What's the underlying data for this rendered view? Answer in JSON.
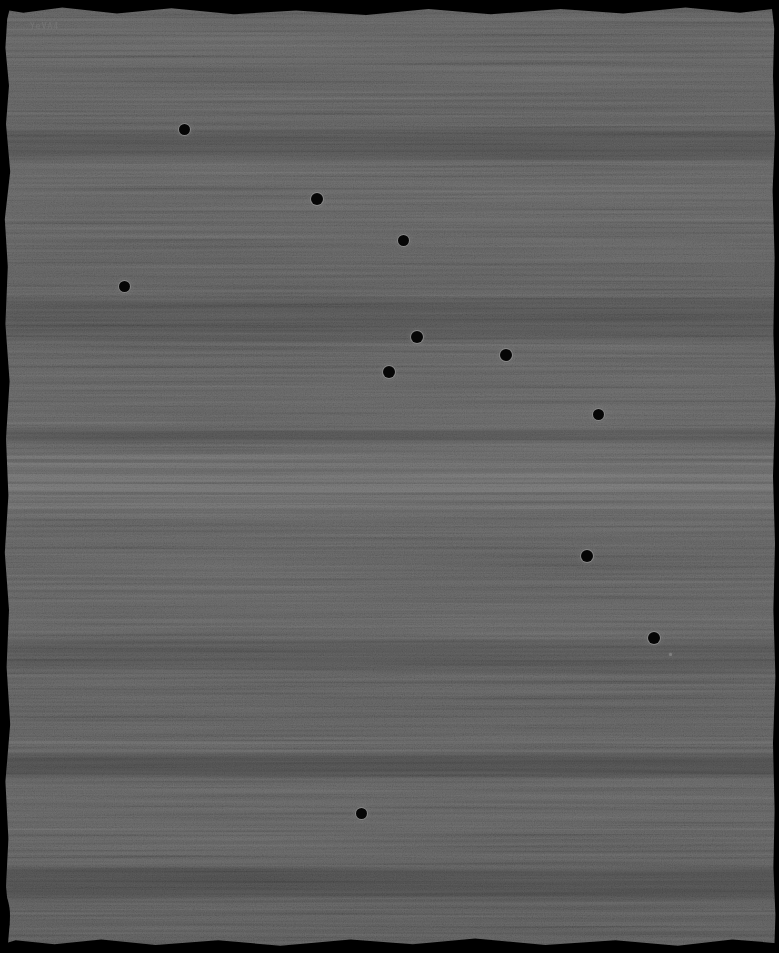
{
  "frame": {
    "label": "YeVA4",
    "width": 779,
    "height": 953,
    "background_color": "#1f1f1f",
    "edge_color": "#000000",
    "hole_core_color": "#060606",
    "hole_rim_color": "#a0a0a0",
    "label_color": "#787878"
  },
  "punch_holes": [
    {
      "x": 184,
      "y": 129,
      "d": 11,
      "type": "hole"
    },
    {
      "x": 317,
      "y": 199,
      "d": 12,
      "type": "hole"
    },
    {
      "x": 403,
      "y": 240,
      "d": 11,
      "type": "hole"
    },
    {
      "x": 124,
      "y": 286,
      "d": 11,
      "type": "hole"
    },
    {
      "x": 417,
      "y": 337,
      "d": 12,
      "type": "hole"
    },
    {
      "x": 506,
      "y": 355,
      "d": 12,
      "type": "hole"
    },
    {
      "x": 389,
      "y": 372,
      "d": 12,
      "type": "hole"
    },
    {
      "x": 598,
      "y": 414,
      "d": 11,
      "type": "hole"
    },
    {
      "x": 587,
      "y": 556,
      "d": 12,
      "type": "hole"
    },
    {
      "x": 654,
      "y": 638,
      "d": 12,
      "type": "hole"
    },
    {
      "x": 670,
      "y": 654,
      "d": 3,
      "type": "speck"
    },
    {
      "x": 361,
      "y": 813,
      "d": 11,
      "type": "hole"
    }
  ],
  "light_bands": [
    {
      "y": 18,
      "h": 3,
      "opacity": 0.05
    },
    {
      "y": 58,
      "h": 2,
      "opacity": 0.035
    },
    {
      "y": 98,
      "h": 2,
      "opacity": 0.03
    },
    {
      "y": 162,
      "h": 3,
      "opacity": 0.07
    },
    {
      "y": 235,
      "h": 2,
      "opacity": 0.03
    },
    {
      "y": 333,
      "h": 2,
      "opacity": 0.03
    },
    {
      "y": 440,
      "h": 2,
      "opacity": 0.04
    },
    {
      "y": 455,
      "h": 4,
      "opacity": 0.06
    },
    {
      "y": 463,
      "h": 5,
      "opacity": 0.09
    },
    {
      "y": 474,
      "h": 8,
      "opacity": 0.1
    },
    {
      "y": 484,
      "h": 8,
      "opacity": 0.13
    },
    {
      "y": 495,
      "h": 5,
      "opacity": 0.08
    },
    {
      "y": 503,
      "h": 6,
      "opacity": 0.09
    },
    {
      "y": 514,
      "h": 3,
      "opacity": 0.05
    },
    {
      "y": 585,
      "h": 2,
      "opacity": 0.03
    },
    {
      "y": 741,
      "h": 3,
      "opacity": 0.07
    },
    {
      "y": 828,
      "h": 2,
      "opacity": 0.03
    },
    {
      "y": 922,
      "h": 2,
      "opacity": 0.04
    }
  ],
  "dark_bands": [
    {
      "y": 130,
      "h": 30,
      "opacity": 0.12
    },
    {
      "y": 300,
      "h": 40,
      "opacity": 0.1
    },
    {
      "y": 430,
      "h": 12,
      "opacity": 0.15
    },
    {
      "y": 640,
      "h": 30,
      "opacity": 0.1
    },
    {
      "y": 755,
      "h": 22,
      "opacity": 0.18
    },
    {
      "y": 868,
      "h": 30,
      "opacity": 0.15
    }
  ]
}
